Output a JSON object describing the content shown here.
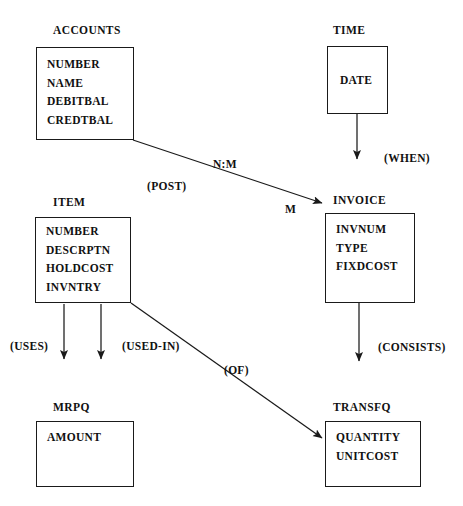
{
  "diagram": {
    "title": "THE INTEGRATED DATABASE MODEL",
    "type": "entity-relationship-diagram",
    "line_color": "#1a1a1a",
    "text_color": "#111111",
    "background": "#ffffff"
  },
  "entities": [
    {
      "id": "accounts",
      "name": "ACCOUNTS",
      "attributes": [
        "NUMBER",
        "NAME",
        "DEBITBAL",
        "CREDTBAL"
      ]
    },
    {
      "id": "time",
      "name": "TIME",
      "attributes": [
        "DATE"
      ]
    },
    {
      "id": "item",
      "name": "ITEM",
      "attributes": [
        "NUMBER",
        "DESCRPTN",
        "HOLDCOST",
        "INVNTRY"
      ]
    },
    {
      "id": "invoice",
      "name": "INVOICE",
      "attributes": [
        "INVNUM",
        "TYPE",
        "FIXDCOST"
      ]
    },
    {
      "id": "mrpq",
      "name": "MRPQ",
      "attributes": [
        "AMOUNT"
      ]
    },
    {
      "id": "transfq",
      "name": "TRANSFQ",
      "attributes": [
        "QUANTITY",
        "UNITCOST"
      ]
    }
  ],
  "edge_labels": {
    "cardinality_nm": "N:M",
    "cardinality_m": "M",
    "post": "(POST)",
    "when": "(WHEN)",
    "uses": "(USES)",
    "used_in": "(USED-IN)",
    "of": "(OF)",
    "consists": "(CONSISTS)"
  },
  "relationships": [
    {
      "from": "accounts",
      "to": "invoice",
      "label": "(POST)",
      "cardinality": "N:M",
      "target_cardinality": "M",
      "style": "diagonal-arrow"
    },
    {
      "from": "time",
      "to": "",
      "label": "(WHEN)",
      "style": "vertical-arrow"
    },
    {
      "from": "item",
      "to": "",
      "label": "(USES)",
      "style": "vertical-arrow"
    },
    {
      "from": "item",
      "to": "",
      "label": "(USED-IN)",
      "style": "vertical-arrow"
    },
    {
      "from": "item",
      "to": "transfq",
      "label": "(OF)",
      "style": "diagonal-arrow"
    },
    {
      "from": "invoice",
      "to": "",
      "label": "(CONSISTS)",
      "style": "vertical-arrow"
    }
  ]
}
